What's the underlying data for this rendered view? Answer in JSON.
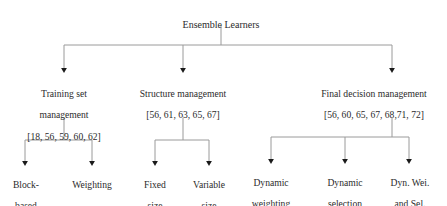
{
  "diagram": {
    "type": "hierarchy-tree",
    "colors": {
      "text": "#2b2b2b",
      "connector": "#9a9a9a",
      "arrowhead": "#1a1a1a",
      "background": "#ffffff"
    },
    "root": {
      "label": "Ensemble Learners"
    },
    "level2": [
      {
        "id": "training-set-management",
        "line1": "Training set",
        "line2": "management",
        "line3": "[18, 56, 59, 60, 62]"
      },
      {
        "id": "structure-management",
        "line1": "Structure management",
        "line2": "[56, 61, 63, 65, 67]",
        "line3": ""
      },
      {
        "id": "final-decision-management",
        "line1": "Final decision management",
        "line2": "[56, 60, 65, 67, 68,71, 72]",
        "line3": ""
      }
    ],
    "leaves": [
      {
        "id": "block-based",
        "line1": "Block-",
        "line2": "based"
      },
      {
        "id": "weighting",
        "line1": "Weighting",
        "line2": ""
      },
      {
        "id": "fixed-size",
        "line1": "Fixed",
        "line2": "size"
      },
      {
        "id": "variable-size",
        "line1": "Variable",
        "line2": "size"
      },
      {
        "id": "dynamic-weighting",
        "line1": "Dynamic",
        "line2": "weighting"
      },
      {
        "id": "dynamic-selection",
        "line1": "Dynamic",
        "line2": "selection"
      },
      {
        "id": "dyn-wei-and-sel",
        "line1": "Dyn. Wei.",
        "line2": "and Sel."
      }
    ]
  }
}
